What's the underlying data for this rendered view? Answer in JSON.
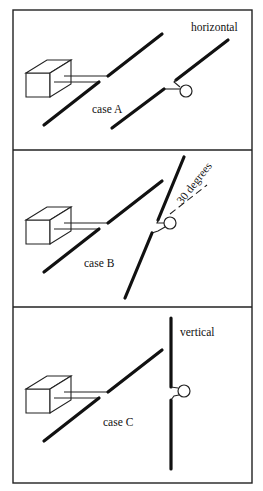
{
  "figure": {
    "panels": [
      {
        "id": "A",
        "case_label": "case A",
        "orientation_label": "horizontal",
        "description": "Source box with feed line to a diagonal slot on the left; right conductor slot with circular element aligned horizontally"
      },
      {
        "id": "B",
        "case_label": "case B",
        "orientation_label": "30 degrees",
        "description": "Right conductor slot rotated 30 degrees, shown with dashed reference line"
      },
      {
        "id": "C",
        "case_label": "case C",
        "orientation_label": "vertical",
        "description": "Right conductor slot rotated to vertical orientation"
      }
    ],
    "colors": {
      "line": "#111111",
      "frame": "#222222",
      "background": "#ffffff"
    }
  }
}
